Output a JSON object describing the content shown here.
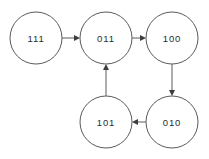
{
  "diagram": {
    "type": "state-transition-graph",
    "background_color": "#ffffff",
    "node_stroke_color": "#5a5a5a",
    "edge_color": "#5a5a5a",
    "label_color": "#2b2b2b",
    "nodes": [
      {
        "id": "n111",
        "label": "111",
        "cx": 36,
        "cy": 38,
        "r": 26
      },
      {
        "id": "n011",
        "label": "011",
        "cx": 106,
        "cy": 38,
        "r": 26
      },
      {
        "id": "n100",
        "label": "100",
        "cx": 172,
        "cy": 38,
        "r": 26
      },
      {
        "id": "n101",
        "label": "101",
        "cx": 106,
        "cy": 122,
        "r": 26
      },
      {
        "id": "n010",
        "label": "010",
        "cx": 172,
        "cy": 122,
        "r": 26
      }
    ],
    "edges": [
      {
        "id": "e1",
        "from": "111",
        "to": "011",
        "direction": "right"
      },
      {
        "id": "e2",
        "from": "011",
        "to": "100",
        "direction": "right"
      },
      {
        "id": "e3",
        "from": "100",
        "to": "010",
        "direction": "down"
      },
      {
        "id": "e4",
        "from": "010",
        "to": "101",
        "direction": "left"
      },
      {
        "id": "e5",
        "from": "101",
        "to": "011",
        "direction": "up"
      }
    ]
  }
}
